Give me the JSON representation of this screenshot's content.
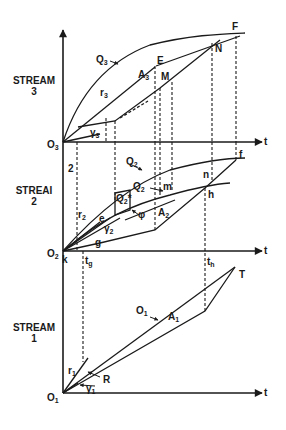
{
  "streams": [
    {
      "name": "STREAM",
      "number": "3"
    },
    {
      "name": "STREAI",
      "number": "2"
    },
    {
      "name": "STREAM",
      "number": "1"
    }
  ],
  "axes": {
    "time_label": "t",
    "origins": [
      "O3",
      "O2",
      "O1"
    ]
  },
  "labels": {
    "stream3": {
      "Q": "Q3",
      "r": "r3",
      "gamma": "Y3",
      "A": "A3",
      "E": "E",
      "M": "M",
      "N": "N",
      "F": "F"
    },
    "stream2": {
      "Q": "Q2",
      "Qstar": "Q2*",
      "Qhat": "Q2",
      "r": "r2",
      "gamma": "Y2",
      "A": "A2",
      "e": "e",
      "g": "g",
      "k": "k",
      "m": "m",
      "n": "n",
      "h": "h",
      "f": "f",
      "phi": "φ",
      "two": "2",
      "tg": "tg",
      "th": "th"
    },
    "stream1": {
      "O": "O1",
      "A": "A1",
      "r": "r1",
      "gamma": "Y1",
      "R": "R",
      "T": "T"
    }
  },
  "colors": {
    "ink": "#1a1a1a",
    "background": "#ffffff"
  }
}
